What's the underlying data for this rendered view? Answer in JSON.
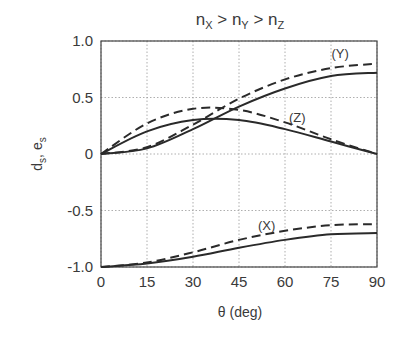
{
  "chart_data": {
    "type": "line",
    "title_parts": [
      {
        "text": "n",
        "sub": "X"
      },
      {
        "text": " > n",
        "sub": "Y"
      },
      {
        "text": " > n",
        "sub": "Z"
      }
    ],
    "xlabel": "θ (deg)",
    "ylabel": "d_s, e_s",
    "ylabel_parts": [
      {
        "text": "d",
        "sub": "s"
      },
      {
        "text": ", e",
        "sub": "s"
      }
    ],
    "xlim": [
      0,
      90
    ],
    "ylim": [
      -1.0,
      1.0
    ],
    "xticks": [
      0,
      15,
      30,
      45,
      60,
      75,
      90
    ],
    "xtick_labels": [
      "0",
      "15",
      "30",
      "45",
      "60",
      "75",
      "90"
    ],
    "yticks": [
      1.0,
      0.5,
      0,
      -0.5,
      -1.0
    ],
    "ytick_labels": [
      "1.0",
      "0.5",
      "0",
      "-0.5",
      "-1.0"
    ],
    "grid": true,
    "legend": "inline curve labels",
    "x": [
      0,
      15,
      30,
      45,
      60,
      75,
      90
    ],
    "series": [
      {
        "name": "(Y) dashed",
        "group": "Y",
        "style": "dashed",
        "values": [
          0,
          0.06,
          0.26,
          0.49,
          0.66,
          0.76,
          0.8
        ]
      },
      {
        "name": "(Y) solid",
        "group": "Y",
        "style": "solid",
        "values": [
          0,
          0.05,
          0.22,
          0.42,
          0.58,
          0.69,
          0.72
        ]
      },
      {
        "name": "(Z) dashed",
        "group": "Z",
        "style": "dashed",
        "values": [
          0,
          0.27,
          0.4,
          0.39,
          0.28,
          0.13,
          0
        ]
      },
      {
        "name": "(Z) solid",
        "group": "Z",
        "style": "solid",
        "values": [
          0,
          0.2,
          0.3,
          0.3,
          0.22,
          0.11,
          0
        ]
      },
      {
        "name": "(X) dashed",
        "group": "X",
        "style": "dashed",
        "values": [
          -1.0,
          -0.96,
          -0.87,
          -0.76,
          -0.68,
          -0.63,
          -0.62
        ]
      },
      {
        "name": "(X) solid",
        "group": "X",
        "style": "solid",
        "values": [
          -1.0,
          -0.97,
          -0.91,
          -0.83,
          -0.76,
          -0.71,
          -0.7
        ]
      }
    ],
    "annotations": [
      {
        "text": "(Y)",
        "x": 78,
        "y": 0.85
      },
      {
        "text": "(Z)",
        "x": 64,
        "y": 0.28
      },
      {
        "text": "(X)",
        "x": 54,
        "y": -0.67
      }
    ]
  }
}
